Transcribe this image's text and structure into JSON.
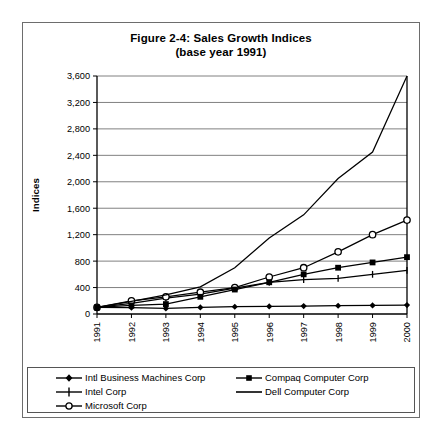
{
  "figure": {
    "title_line1": "Figure 2-4: Sales Growth Indices",
    "title_line2": "(base year 1991)"
  },
  "chart_data": {
    "type": "line",
    "title": "Figure 2-4: Sales Growth Indices (base year 1991)",
    "xlabel": "",
    "ylabel": "Indices",
    "x": [
      1991,
      1992,
      1993,
      1994,
      1995,
      1996,
      1997,
      1998,
      1999,
      2000
    ],
    "xtick_labels": [
      "1991",
      "1992",
      "1993",
      "1994",
      "1995",
      "1996",
      "1997",
      "1998",
      "1999",
      "2000"
    ],
    "ytick_labels": [
      "0",
      "400",
      "800",
      "1,200",
      "1,600",
      "2,000",
      "2,400",
      "2,800",
      "3,200",
      "3,600"
    ],
    "yticks": [
      0,
      400,
      800,
      1200,
      1600,
      2000,
      2400,
      2800,
      3200,
      3600
    ],
    "ylim": [
      0,
      3600
    ],
    "grid": true,
    "legend_position": "bottom",
    "series": [
      {
        "name": "Intl Business Machines Corp",
        "marker": "filled-diamond",
        "color": "#000000",
        "values": [
          100,
          95,
          85,
          100,
          110,
          115,
          120,
          125,
          130,
          135
        ]
      },
      {
        "name": "Intel Corp",
        "marker": "plus",
        "color": "#000000",
        "values": [
          100,
          160,
          240,
          300,
          390,
          480,
          520,
          540,
          600,
          660
        ]
      },
      {
        "name": "Microsoft Corp",
        "marker": "open-circle",
        "color": "#000000",
        "values": [
          100,
          200,
          260,
          330,
          400,
          560,
          700,
          940,
          1200,
          1420
        ]
      },
      {
        "name": "Compaq Computer Corp",
        "marker": "filled-square",
        "color": "#000000",
        "values": [
          100,
          130,
          150,
          260,
          370,
          480,
          600,
          700,
          780,
          860
        ]
      },
      {
        "name": "Dell Computer Corp",
        "marker": "none",
        "color": "#000000",
        "values": [
          100,
          190,
          290,
          410,
          700,
          1150,
          1500,
          2050,
          2450,
          3600
        ]
      }
    ]
  }
}
